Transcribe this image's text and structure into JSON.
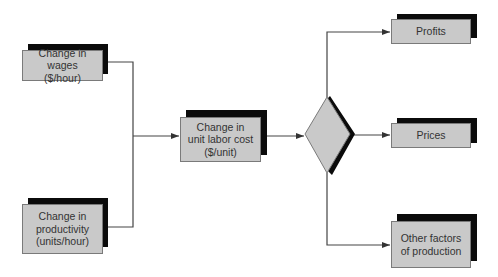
{
  "diagram": {
    "type": "flowchart",
    "colors": {
      "box_fill": "#c9c9c9",
      "box_border": "#7a7a7a",
      "shadow": "#0b0b0b",
      "line": "#444444",
      "text": "#333333",
      "background": "#ffffff"
    },
    "nodes": {
      "wages": {
        "label": "Change in wages\n($/hour)"
      },
      "productivity": {
        "label": "Change in\nproductivity\n(units/hour)"
      },
      "unit_labor_cost": {
        "label": "Change in\nunit labor cost\n($/unit)"
      },
      "decision": {
        "label": ""
      },
      "profits": {
        "label": "Profits"
      },
      "prices": {
        "label": "Prices"
      },
      "other_factors": {
        "label": "Other factors\nof production"
      }
    },
    "edges": [
      {
        "from": "wages",
        "to": "unit_labor_cost"
      },
      {
        "from": "productivity",
        "to": "unit_labor_cost"
      },
      {
        "from": "unit_labor_cost",
        "to": "decision"
      },
      {
        "from": "decision",
        "to": "profits"
      },
      {
        "from": "decision",
        "to": "prices"
      },
      {
        "from": "decision",
        "to": "other_factors"
      }
    ]
  }
}
